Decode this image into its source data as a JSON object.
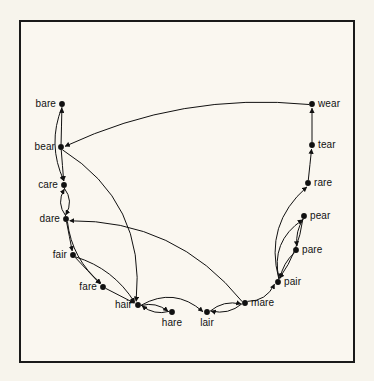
{
  "figure": {
    "type": "directed-graph",
    "background_color": "#f7f4ec",
    "panel_color": "#faf7f0",
    "border_color": "#1a1a1a",
    "ink_color": "#111111"
  },
  "graph_data": {
    "type": "node-link-diagram",
    "directed": true,
    "node_count": 15,
    "edge_count": 26,
    "nodes": [
      {
        "id": "bare",
        "label": "bare",
        "x": 62,
        "y": 104,
        "label_side": "left"
      },
      {
        "id": "bear",
        "label": "bear",
        "x": 61,
        "y": 147,
        "label_side": "left"
      },
      {
        "id": "care",
        "label": "care",
        "x": 64,
        "y": 185,
        "label_side": "left"
      },
      {
        "id": "dare",
        "label": "dare",
        "x": 66,
        "y": 219,
        "label_side": "left"
      },
      {
        "id": "fair",
        "label": "fair",
        "x": 73,
        "y": 255,
        "label_side": "left"
      },
      {
        "id": "fare",
        "label": "fare",
        "x": 103,
        "y": 287,
        "label_side": "left"
      },
      {
        "id": "hair",
        "label": "hair",
        "x": 138,
        "y": 305,
        "label_side": "left"
      },
      {
        "id": "hare",
        "label": "hare",
        "x": 172,
        "y": 312,
        "label_side": "below"
      },
      {
        "id": "lair",
        "label": "lair",
        "x": 207,
        "y": 312,
        "label_side": "below"
      },
      {
        "id": "mare",
        "label": "mare",
        "x": 245,
        "y": 303,
        "label_side": "right"
      },
      {
        "id": "pair",
        "label": "pair",
        "x": 278,
        "y": 282,
        "label_side": "right"
      },
      {
        "id": "pare",
        "label": "pare",
        "x": 296,
        "y": 250,
        "label_side": "right"
      },
      {
        "id": "pear",
        "label": "pear",
        "x": 304,
        "y": 216,
        "label_side": "right"
      },
      {
        "id": "rare",
        "label": "rare",
        "x": 308,
        "y": 183,
        "label_side": "right"
      },
      {
        "id": "tear",
        "label": "tear",
        "x": 312,
        "y": 145,
        "label_side": "right"
      },
      {
        "id": "wear",
        "label": "wear",
        "x": 312,
        "y": 104,
        "label_side": "right"
      }
    ],
    "edges": [
      {
        "from": "bear",
        "to": "bare",
        "curve": 0
      },
      {
        "from": "bare",
        "to": "care",
        "curve": 16
      },
      {
        "from": "bear",
        "to": "care",
        "curve": 0
      },
      {
        "from": "care",
        "to": "dare",
        "curve": -9
      },
      {
        "from": "dare",
        "to": "care",
        "curve": -9
      },
      {
        "from": "dare",
        "to": "fair",
        "curve": 0
      },
      {
        "from": "fair",
        "to": "fare",
        "curve": 0
      },
      {
        "from": "dare",
        "to": "fare",
        "curve": 14
      },
      {
        "from": "fair",
        "to": "hair",
        "curve": -14
      },
      {
        "from": "fare",
        "to": "hair",
        "curve": 0
      },
      {
        "from": "hair",
        "to": "hare",
        "curve": -7
      },
      {
        "from": "hare",
        "to": "hair",
        "curve": -7
      },
      {
        "from": "hair",
        "to": "lair",
        "curve": -22
      },
      {
        "from": "lair",
        "to": "mare",
        "curve": -8
      },
      {
        "from": "mare",
        "to": "lair",
        "curve": -8
      },
      {
        "from": "mare",
        "to": "pair",
        "curve": 10
      },
      {
        "from": "pair",
        "to": "pear",
        "curve": -22
      },
      {
        "from": "pear",
        "to": "pair",
        "curve": -8
      },
      {
        "from": "pear",
        "to": "pare",
        "curve": 5
      },
      {
        "from": "pare",
        "to": "pair",
        "curve": 5
      },
      {
        "from": "pair",
        "to": "rare",
        "curve": -30
      },
      {
        "from": "rare",
        "to": "tear",
        "curve": 0
      },
      {
        "from": "tear",
        "to": "wear",
        "curve": 0
      },
      {
        "from": "wear",
        "to": "bear",
        "curve": 34
      },
      {
        "from": "bear",
        "to": "hair",
        "curve": -52
      },
      {
        "from": "mare",
        "to": "dare",
        "curve": 46
      }
    ]
  }
}
